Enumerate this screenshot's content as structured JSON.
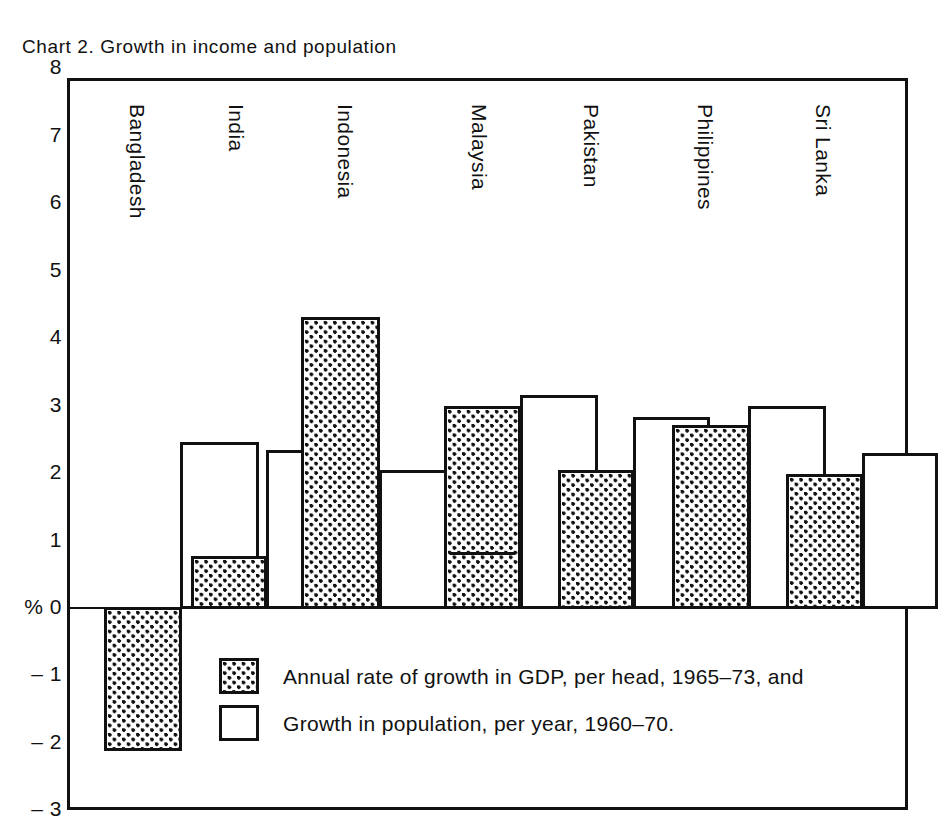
{
  "chart_data": {
    "type": "bar",
    "title": "Chart 2.  Growth in income and population",
    "xlabel": "",
    "ylabel": "%",
    "ylim": [
      -3,
      8
    ],
    "ytick_labels": [
      "8",
      "7",
      "6",
      "5",
      "4",
      "3",
      "2",
      "1",
      "% 0",
      "– 1",
      "– 2",
      "– 3"
    ],
    "ytick_values": [
      8,
      7,
      6,
      5,
      4,
      3,
      2,
      1,
      0,
      -1,
      -2,
      -3
    ],
    "grid": false,
    "legend_position": "inside-lower-center",
    "categories": [
      "Bangladesh",
      "India",
      "Indonesia",
      "Malaysia",
      "Pakistan",
      "Philippines",
      "Sri Lanka"
    ],
    "series": [
      {
        "name": "Annual rate of growth in GDP, per head, 1965–73, and",
        "fill": "dotted",
        "values": [
          -2.1,
          0.75,
          4.3,
          2.98,
          2.03,
          2.7,
          1.97
        ]
      },
      {
        "name": "Growth in population, per year, 1960–70.",
        "fill": "white",
        "values": [
          2.45,
          2.33,
          2.03,
          3.15,
          2.82,
          2.98,
          2.28
        ]
      }
    ]
  },
  "title": {
    "text": "Chart 2.  Growth in income and population"
  },
  "axis": {
    "unit_label": "%",
    "ticks": [
      {
        "label": "8"
      },
      {
        "label": "7"
      },
      {
        "label": "6"
      },
      {
        "label": "5"
      },
      {
        "label": "4"
      },
      {
        "label": "3"
      },
      {
        "label": "2"
      },
      {
        "label": "1"
      },
      {
        "label": "% 0"
      },
      {
        "label": "– 1"
      },
      {
        "label": "– 2"
      },
      {
        "label": "– 3"
      }
    ]
  },
  "countries": [
    {
      "label": "Bangladesh"
    },
    {
      "label": "India"
    },
    {
      "label": "Indonesia"
    },
    {
      "label": "Malaysia"
    },
    {
      "label": "Pakistan"
    },
    {
      "label": "Philippines"
    },
    {
      "label": "Sri Lanka"
    }
  ],
  "legend": {
    "items": [
      {
        "swatch": "dotted",
        "label": "Annual rate of growth in GDP, per head, 1965–73, and"
      },
      {
        "swatch": "white",
        "label": "Growth in population, per year, 1960–70."
      }
    ]
  },
  "colors": {
    "ink": "#111111",
    "paper": "#ffffff"
  }
}
